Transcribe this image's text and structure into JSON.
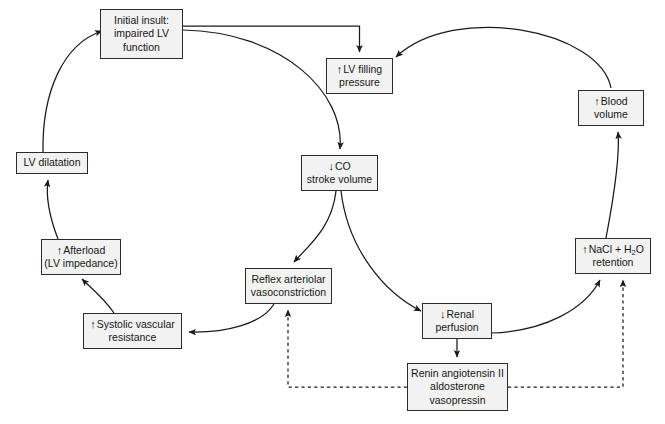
{
  "diagram": {
    "type": "flowchart",
    "background_color": "#ffffff",
    "node_fill_color": "#f2f2f2",
    "node_border_color": "#2b2b2b",
    "text_color": "#161616",
    "edge_color": "#1a1a1a",
    "nodes": [
      {
        "id": "initial-insult",
        "arrow": "",
        "lines": [
          "Initial insult:",
          "impaired LV",
          "function"
        ],
        "x": 100,
        "y": 9,
        "w": 83,
        "h": 50
      },
      {
        "id": "lv-filling-pressure",
        "arrow": "↑",
        "lines": [
          "LV filling",
          "pressure"
        ],
        "arrow_line_index": 0,
        "x": 326,
        "y": 58,
        "w": 67,
        "h": 36
      },
      {
        "id": "blood-volume",
        "arrow": "↑",
        "lines": [
          "Blood",
          "volume"
        ],
        "arrow_line_index": 0,
        "x": 578,
        "y": 90,
        "w": 66,
        "h": 36
      },
      {
        "id": "co-stroke-volume",
        "arrow": "↓",
        "lines": [
          "CO",
          "stroke volume"
        ],
        "arrow_line_index": 0,
        "x": 301,
        "y": 155,
        "w": 77,
        "h": 36
      },
      {
        "id": "lv-dilatation",
        "arrow": "",
        "lines": [
          "LV dilatation"
        ],
        "x": 16,
        "y": 152,
        "w": 72,
        "h": 22
      },
      {
        "id": "afterload",
        "arrow": "↑",
        "lines": [
          "Afterload",
          "(LV impedance)"
        ],
        "arrow_line_index": 0,
        "x": 41,
        "y": 239,
        "w": 80,
        "h": 36
      },
      {
        "id": "nacl-retention",
        "arrow": "↑",
        "lines": [
          "NaCl + H2O",
          "retention"
        ],
        "arrow_line_index": 0,
        "x": 575,
        "y": 238,
        "w": 76,
        "h": 36
      },
      {
        "id": "reflex-vasoconstriction",
        "arrow": "",
        "lines": [
          "Reflex arteriolar",
          "vasoconstriction"
        ],
        "x": 245,
        "y": 268,
        "w": 87,
        "h": 36
      },
      {
        "id": "renal-perfusion",
        "arrow": "↓",
        "lines": [
          "Renal",
          "perfusion"
        ],
        "arrow_line_index": 0,
        "x": 422,
        "y": 303,
        "w": 70,
        "h": 36
      },
      {
        "id": "systolic-vascular-resistance",
        "arrow": "↑",
        "lines": [
          "Systolic vascular",
          "resistance"
        ],
        "arrow_line_index": 0,
        "x": 83,
        "y": 313,
        "w": 99,
        "h": 36
      },
      {
        "id": "renin-angiotensin",
        "arrow": "",
        "lines": [
          "Renin angiotensin II",
          "aldosterone",
          "vasopressin"
        ],
        "x": 407,
        "y": 363,
        "w": 101,
        "h": 48
      }
    ],
    "edges": [
      {
        "id": "initial-insult-to-lv-filling",
        "from": "initial-insult",
        "to": "lv-filling-pressure",
        "style": "solid"
      },
      {
        "id": "initial-insult-to-co",
        "from": "initial-insult",
        "to": "co-stroke-volume",
        "style": "solid"
      },
      {
        "id": "blood-volume-to-lv-filling",
        "from": "blood-volume",
        "to": "lv-filling-pressure",
        "style": "solid"
      },
      {
        "id": "co-to-reflex-vasoconstriction",
        "from": "co-stroke-volume",
        "to": "reflex-vasoconstriction",
        "style": "solid"
      },
      {
        "id": "co-to-renal-perfusion",
        "from": "co-stroke-volume",
        "to": "renal-perfusion",
        "style": "solid"
      },
      {
        "id": "reflex-to-systolic-resistance",
        "from": "reflex-vasoconstriction",
        "to": "systolic-vascular-resistance",
        "style": "solid"
      },
      {
        "id": "systolic-resistance-to-afterload",
        "from": "systolic-vascular-resistance",
        "to": "afterload",
        "style": "solid"
      },
      {
        "id": "afterload-to-lv-dilatation",
        "from": "afterload",
        "to": "lv-dilatation",
        "style": "solid"
      },
      {
        "id": "lv-dilatation-to-initial-insult",
        "from": "lv-dilatation",
        "to": "initial-insult",
        "style": "solid"
      },
      {
        "id": "renal-perfusion-to-renin",
        "from": "renal-perfusion",
        "to": "renin-angiotensin",
        "style": "solid"
      },
      {
        "id": "renal-perfusion-to-nacl",
        "from": "renal-perfusion",
        "to": "nacl-retention",
        "style": "solid"
      },
      {
        "id": "nacl-to-blood-volume",
        "from": "nacl-retention",
        "to": "blood-volume",
        "style": "solid"
      },
      {
        "id": "renin-to-reflex-vasoconstriction",
        "from": "renin-angiotensin",
        "to": "reflex-vasoconstriction",
        "style": "dashed"
      },
      {
        "id": "renin-to-nacl",
        "from": "renin-angiotensin",
        "to": "nacl-retention",
        "style": "dashed"
      }
    ]
  }
}
